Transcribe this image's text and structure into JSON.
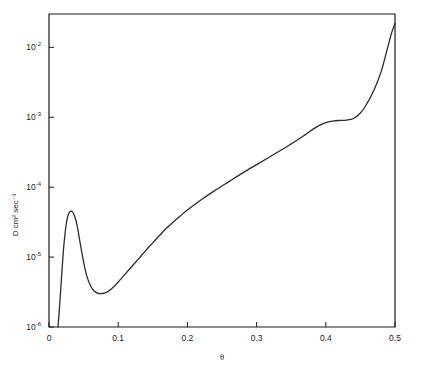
{
  "figure": {
    "background": "#ffffff",
    "line_color": "#2b2b2b",
    "axis_color": "#1a1a1a"
  },
  "chart_data": {
    "type": "line",
    "title": "",
    "subtitle": "",
    "xlabel": "θ",
    "ylabel": "D  cm² sec⁻¹",
    "xscale": "linear",
    "yscale": "log",
    "xlim": [
      0,
      0.5
    ],
    "ylim": [
      1e-06,
      0.03
    ],
    "grid": false,
    "legend": null,
    "xticks": [
      0,
      0.1,
      0.2,
      0.3,
      0.4,
      0.5
    ],
    "xtick_labels": [
      "0",
      "0.1",
      "0.2",
      "0.3",
      "0.4",
      "0.5"
    ],
    "yticks": [
      1e-06,
      1e-05,
      0.0001,
      0.001,
      0.01
    ],
    "ytick_labels": [
      "10⁻⁶",
      "10⁻⁵",
      "10⁻⁴",
      "10⁻³",
      "10⁻²"
    ],
    "ytick_mantissa": "10",
    "ytick_exponents": [
      "-6",
      "-5",
      "-4",
      "-3",
      "-2"
    ],
    "series": [
      {
        "name": "D(θ)",
        "x": [
          0.013,
          0.015,
          0.017,
          0.019,
          0.021,
          0.023,
          0.025,
          0.027,
          0.029,
          0.031,
          0.033,
          0.035,
          0.038,
          0.041,
          0.045,
          0.05,
          0.055,
          0.06,
          0.065,
          0.07,
          0.075,
          0.08,
          0.085,
          0.09,
          0.095,
          0.1,
          0.11,
          0.12,
          0.13,
          0.14,
          0.15,
          0.16,
          0.17,
          0.18,
          0.19,
          0.2,
          0.22,
          0.24,
          0.26,
          0.28,
          0.3,
          0.32,
          0.34,
          0.36,
          0.37,
          0.38,
          0.39,
          0.4,
          0.41,
          0.42,
          0.43,
          0.44,
          0.45,
          0.46,
          0.47,
          0.48,
          0.49,
          0.495,
          0.5
        ],
        "y": [
          1e-06,
          1.8e-06,
          3.5e-06,
          7e-06,
          1.3e-05,
          2.1e-05,
          3e-05,
          3.8e-05,
          4.3e-05,
          4.5e-05,
          4.5e-05,
          4.3e-05,
          3.6e-05,
          2.7e-05,
          1.6e-05,
          8.5e-06,
          5.2e-06,
          3.9e-06,
          3.3e-06,
          3.05e-06,
          3e-06,
          3.05e-06,
          3.2e-06,
          3.5e-06,
          3.9e-06,
          4.4e-06,
          5.7e-06,
          7.4e-06,
          9.6e-06,
          1.25e-05,
          1.6e-05,
          2.05e-05,
          2.6e-05,
          3.2e-05,
          3.9e-05,
          4.7e-05,
          6.6e-05,
          9e-05,
          0.00012,
          0.00016,
          0.00021,
          0.000275,
          0.00036,
          0.00048,
          0.00056,
          0.00066,
          0.00076,
          0.00084,
          0.00088,
          0.0009,
          0.00091,
          0.00096,
          0.00115,
          0.0016,
          0.0025,
          0.0045,
          0.0105,
          0.016,
          0.022
        ]
      }
    ],
    "annotations": [
      {
        "text": "local maximum",
        "x": 0.033,
        "y": 4.5e-05
      },
      {
        "text": "local minimum",
        "x": 0.076,
        "y": 3e-06
      },
      {
        "text": "plateau",
        "x": 0.415,
        "y": 0.0009
      }
    ]
  }
}
